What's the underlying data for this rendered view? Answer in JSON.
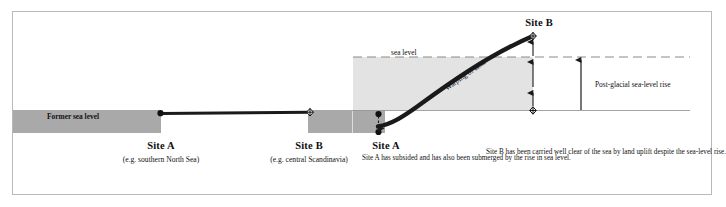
{
  "diagram": {
    "type": "geological-cross-section"
  },
  "left_panel": {
    "former_sea_level_label": "Former sea level",
    "site_a": {
      "title": "Site A",
      "subtitle": "(e.g. southern North Sea)"
    },
    "site_b": {
      "title": "Site B",
      "subtitle": "(e.g. central Scandinavia)"
    }
  },
  "right_panel": {
    "sea_level_label": "sea level",
    "warping_label": "Warping of land",
    "post_glacial_label": "Post-glacial sea-level rise",
    "site_a": {
      "title": "Site A",
      "note": "Site A has subsided and has also been submerged by the rise in sea level."
    },
    "site_b": {
      "title": "Site B",
      "note": "Site B has been carried well clear of the sea by land uplift despite the sea-level rise."
    }
  },
  "colors": {
    "land_dark": "#a9a9a9",
    "sea_light": "#e3e3e3",
    "line_black": "#1a1a1a",
    "frame_border": "#b9b9b9",
    "text": "#111111"
  }
}
